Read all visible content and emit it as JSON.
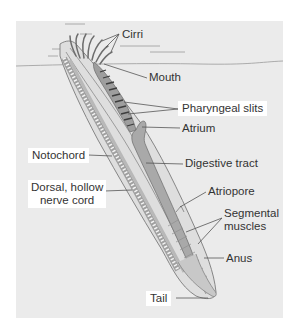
{
  "diagram": {
    "labels": {
      "cirri": "Cirri",
      "mouth": "Mouth",
      "pharyngeal_slits": "Pharyngeal slits",
      "atrium": "Atrium",
      "notochord": "Notochord",
      "digestive_tract": "Digestive tract",
      "nerve_cord_line1": "Dorsal, hollow",
      "nerve_cord_line2": "nerve cord",
      "atriopore": "Atriopore",
      "segmental_line1": "Segmental",
      "segmental_line2": "muscles",
      "anus": "Anus",
      "tail": "Tail"
    },
    "colors": {
      "panel_bg": "#ebebeb",
      "label_box": "#ffffff",
      "leader_line": "#555555",
      "body_outline": "#7a7a7a",
      "gut_fill": "#a9a9a9"
    }
  }
}
